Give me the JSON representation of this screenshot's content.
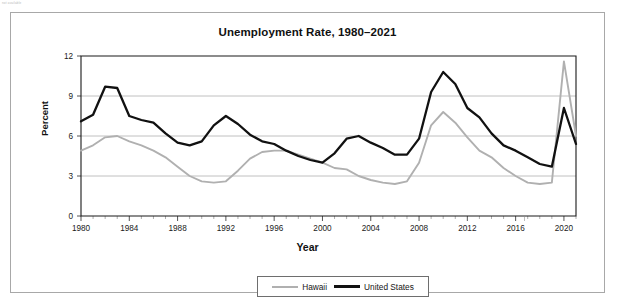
{
  "page": {
    "corner_note": "not available"
  },
  "figure": {
    "title": "Unemployment Rate, 1980–2021",
    "xlabel": "Year",
    "ylabel": "Percent"
  },
  "legend": {
    "position": "bottom-center",
    "items": [
      {
        "label": "Hawaii",
        "color": "#b0b0b0"
      },
      {
        "label": "United States",
        "color": "#111111"
      }
    ]
  },
  "axis": {
    "y_ticks": [
      "0",
      "3",
      "6",
      "9",
      "12"
    ],
    "x_ticks": [
      "1980",
      "1984",
      "1988",
      "1992",
      "1996",
      "2000",
      "2004",
      "2008",
      "2012",
      "2016",
      "2020"
    ]
  },
  "chart_data": {
    "type": "line",
    "title": "Unemployment Rate, 1980–2021",
    "xlabel": "Year",
    "ylabel": "Percent",
    "xlim": [
      1980,
      2021
    ],
    "ylim": [
      0,
      12
    ],
    "grid": "horizontal",
    "legend_position": "bottom-center",
    "x": [
      1980,
      1981,
      1982,
      1983,
      1984,
      1985,
      1986,
      1987,
      1988,
      1989,
      1990,
      1991,
      1992,
      1993,
      1994,
      1995,
      1996,
      1997,
      1998,
      1999,
      2000,
      2001,
      2002,
      2003,
      2004,
      2005,
      2006,
      2007,
      2008,
      2009,
      2010,
      2011,
      2012,
      2013,
      2014,
      2015,
      2016,
      2017,
      2018,
      2019,
      2020,
      2021
    ],
    "series": [
      {
        "name": "Hawaii",
        "color": "#b0b0b0",
        "values": [
          4.9,
          5.3,
          5.9,
          6.0,
          5.6,
          5.3,
          4.9,
          4.4,
          3.7,
          3.0,
          2.6,
          2.5,
          2.6,
          3.4,
          4.3,
          4.8,
          4.9,
          4.9,
          4.6,
          4.3,
          4.0,
          3.6,
          3.5,
          3.0,
          2.7,
          2.5,
          2.4,
          2.6,
          4.0,
          6.8,
          7.8,
          7.0,
          5.9,
          4.9,
          4.4,
          3.6,
          3.0,
          2.5,
          2.4,
          2.5,
          11.6,
          6.0
        ]
      },
      {
        "name": "United States",
        "color": "#111111",
        "values": [
          7.1,
          7.6,
          9.7,
          9.6,
          7.5,
          7.2,
          7.0,
          6.2,
          5.5,
          5.3,
          5.6,
          6.8,
          7.5,
          6.9,
          6.1,
          5.6,
          5.4,
          4.9,
          4.5,
          4.2,
          4.0,
          4.7,
          5.8,
          6.0,
          5.5,
          5.1,
          4.6,
          4.6,
          5.8,
          9.3,
          10.8,
          9.9,
          8.1,
          7.4,
          6.2,
          5.3,
          4.9,
          4.4,
          3.9,
          3.7,
          8.1,
          5.4
        ]
      }
    ]
  }
}
